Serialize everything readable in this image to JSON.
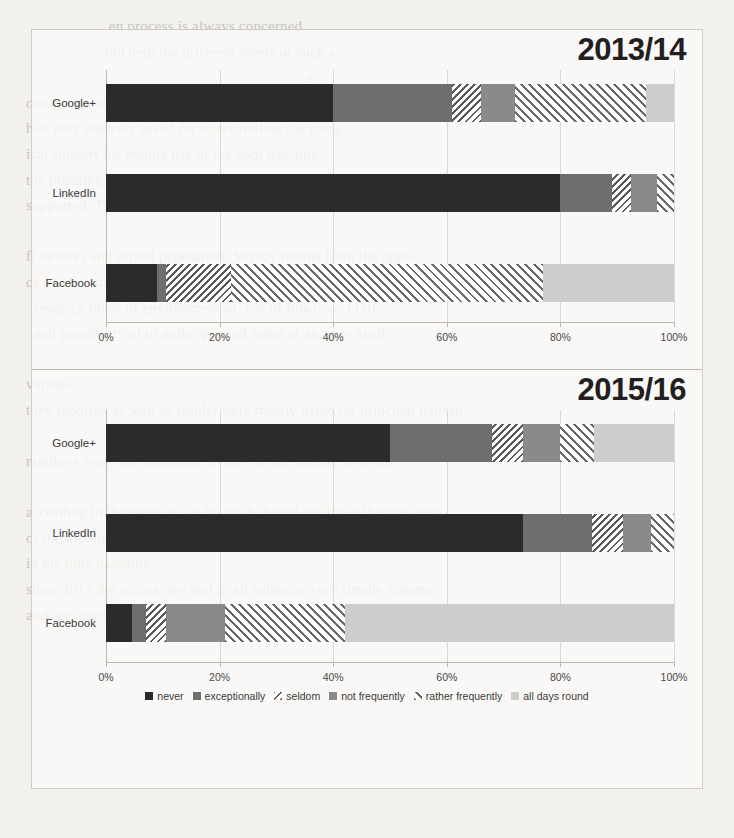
{
  "background_text": "                       en process is always concerned\n                      uld help the different levels of such a\n                                                                         e-\n  ourage the use of mobile devices at home\n  hile only students asked for it; we outline the comp-\n  ical support for mobile use of the own teaching\n  the planning of lectures for students using learning, i.e. the\n  supported. The differences in the difficult use of mobile\n\n  ff devices and mixed population. Survey results from the appli-\n  ce of 10 items to address exploratory the results of the subje-\n    research 06 % of environment of 3 % of functions (110\n    and possibility of of anthropic and some of an once avail\n\n  various\n  they reported as well as results were mostly listed for principal pattern\n\n  numbers were not indicating lecture on the mobile in to the\n\n  according to the reply on all be easily found out the difference type\n  of the mobile phone in a lecture to be more accepted and own survey,\n  in the time handling\n  since 2014 the access, ees and in all subjects, very simple screens\n  and the courses. The very long evaluation showing thrum, marks for\n\n",
  "figure": {
    "panels": [
      {
        "title": "2013/14",
        "categories": [
          "Google+",
          "LinkedIn",
          "Facebook"
        ],
        "xaxis": {
          "ticks": [
            "0%",
            "20%",
            "40%",
            "60%",
            "80%",
            "100%"
          ],
          "values": [
            0,
            20,
            40,
            60,
            80,
            100
          ]
        }
      },
      {
        "title": "2015/16",
        "categories": [
          "Google+",
          "LinkedIn",
          "Facebook"
        ],
        "xaxis": {
          "ticks": [
            "0%",
            "20%",
            "40%",
            "60%",
            "80%",
            "100%"
          ],
          "values": [
            0,
            20,
            40,
            60,
            80,
            100
          ]
        }
      }
    ],
    "legend": [
      {
        "label": "never",
        "key": "never",
        "color": "#2b2b2b",
        "pattern": "solid"
      },
      {
        "label": "exceptionally",
        "key": "excep",
        "color": "#6e6e6e",
        "pattern": "solid"
      },
      {
        "label": "seldom",
        "key": "seldom",
        "color": "#5a5a5a",
        "pattern": "hatch-back"
      },
      {
        "label": "not frequently",
        "key": "notfreq",
        "color": "#8a8a8a",
        "pattern": "solid"
      },
      {
        "label": "rather frequently",
        "key": "rather",
        "color": "#6a6a6a",
        "pattern": "hatch-fwd"
      },
      {
        "label": "all days round",
        "key": "alldays",
        "color": "#cdcdcb",
        "pattern": "solid"
      }
    ]
  },
  "chart_data": [
    {
      "type": "bar",
      "orientation": "horizontal",
      "stacked": true,
      "stack_total": 100,
      "title": "2013/14",
      "xlabel": "",
      "ylabel": "",
      "xlim": [
        0,
        100
      ],
      "xticks": [
        0,
        20,
        40,
        60,
        80,
        100
      ],
      "xticklabels": [
        "0%",
        "20%",
        "40%",
        "60%",
        "80%",
        "100%"
      ],
      "grid": "vertical",
      "legend_position": "bottom",
      "categories": [
        "Google+",
        "LinkedIn",
        "Facebook"
      ],
      "series": [
        {
          "name": "never",
          "values": [
            40.0,
            80.0,
            9.0
          ]
        },
        {
          "name": "exceptionally",
          "values": [
            21.0,
            9.0,
            1.5
          ]
        },
        {
          "name": "seldom",
          "values": [
            5.0,
            3.5,
            11.5
          ]
        },
        {
          "name": "not frequently",
          "values": [
            6.0,
            4.5,
            0.0
          ]
        },
        {
          "name": "rather frequently",
          "values": [
            23.0,
            3.0,
            55.0
          ]
        },
        {
          "name": "all days round",
          "values": [
            5.0,
            0.0,
            23.0
          ]
        }
      ]
    },
    {
      "type": "bar",
      "orientation": "horizontal",
      "stacked": true,
      "stack_total": 100,
      "title": "2015/16",
      "xlabel": "",
      "ylabel": "",
      "xlim": [
        0,
        100
      ],
      "xticks": [
        0,
        20,
        40,
        60,
        80,
        100
      ],
      "xticklabels": [
        "0%",
        "20%",
        "40%",
        "60%",
        "80%",
        "100%"
      ],
      "grid": "vertical",
      "legend_position": "bottom",
      "categories": [
        "Google+",
        "LinkedIn",
        "Facebook"
      ],
      "series": [
        {
          "name": "never",
          "values": [
            50.0,
            73.5,
            4.5
          ]
        },
        {
          "name": "exceptionally",
          "values": [
            18.0,
            12.0,
            2.5
          ]
        },
        {
          "name": "seldom",
          "values": [
            5.5,
            5.5,
            3.5
          ]
        },
        {
          "name": "not frequently",
          "values": [
            6.5,
            5.0,
            10.5
          ]
        },
        {
          "name": "rather frequently",
          "values": [
            6.0,
            4.0,
            21.0
          ]
        },
        {
          "name": "all days round",
          "values": [
            14.0,
            0.0,
            58.0
          ]
        }
      ]
    }
  ]
}
